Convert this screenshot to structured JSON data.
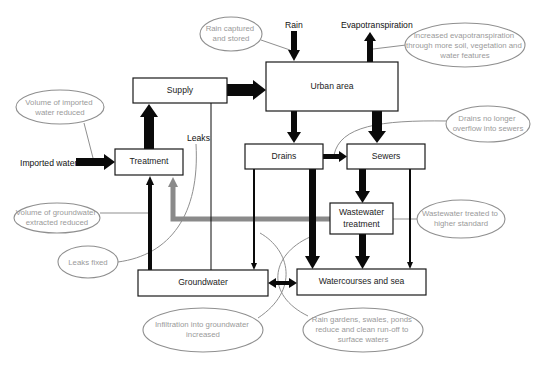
{
  "diagram": {
    "boxes": {
      "supply": {
        "label": "Supply",
        "x": 133,
        "y": 78,
        "w": 94,
        "h": 25
      },
      "urban": {
        "label": "Urban area",
        "x": 266,
        "y": 62,
        "w": 132,
        "h": 49
      },
      "treatment": {
        "label": "Treatment",
        "x": 115,
        "y": 149,
        "w": 68,
        "h": 26
      },
      "drains": {
        "label": "Drains",
        "x": 245,
        "y": 144,
        "w": 78,
        "h": 25
      },
      "sewers": {
        "label": "Sewers",
        "x": 347,
        "y": 144,
        "w": 78,
        "h": 25
      },
      "wastewater": {
        "label_line1": "Wastewater",
        "label_line2": "treatment",
        "x": 330,
        "y": 203,
        "w": 63,
        "h": 31
      },
      "groundwater": {
        "label": "Groundwater",
        "x": 138,
        "y": 270,
        "w": 130,
        "h": 26
      },
      "watercourses": {
        "label": "Watercourses and sea",
        "x": 297,
        "y": 269,
        "w": 129,
        "h": 26
      }
    },
    "flow_labels": {
      "imported_water": "Imported water",
      "rain": "Rain",
      "evapotranspiration": "Evapotranspiration",
      "leaks": "Leaks"
    },
    "notes": {
      "rain_captured": {
        "lines": [
          "Rain captured",
          "and stored"
        ],
        "cx": 231,
        "cy": 34,
        "rx": 31,
        "ry": 17
      },
      "evapotranspiration": {
        "lines": [
          "Increased evapotranspiration",
          "through more soil, vegetation and",
          "water features"
        ],
        "cx": 465,
        "cy": 45,
        "rx": 60,
        "ry": 22
      },
      "imported_reduced": {
        "lines": [
          "Volume of imported",
          "water reduced"
        ],
        "cx": 60,
        "cy": 107,
        "rx": 44,
        "ry": 17
      },
      "drains_no_overflow": {
        "lines": [
          "Drains no longer",
          "overflow into sewers"
        ],
        "cx": 488,
        "cy": 124,
        "rx": 42,
        "ry": 18
      },
      "groundwater_reduced": {
        "lines": [
          "Volume of groundwater",
          "extracted reduced"
        ],
        "cx": 57,
        "cy": 218,
        "rx": 43,
        "ry": 15
      },
      "wastewater_standard": {
        "lines": [
          "Wastewater treated to",
          "higher standard"
        ],
        "cx": 461,
        "cy": 219,
        "rx": 44,
        "ry": 19
      },
      "leaks_fixed": {
        "lines": [
          "Leaks fixed"
        ],
        "cx": 88,
        "cy": 262,
        "rx": 30,
        "ry": 16
      },
      "infiltration": {
        "lines": [
          "Infiltration into groundwater",
          "increased"
        ],
        "cx": 203,
        "cy": 330,
        "rx": 60,
        "ry": 22
      },
      "rain_gardens": {
        "lines": [
          "Rain gardens, swales, ponds",
          "reduce and clean run-off to",
          "surface waters"
        ],
        "cx": 363,
        "cy": 330,
        "rx": 60,
        "ry": 22
      }
    },
    "colors": {
      "box_stroke": "#1a1a1a",
      "flow_black": "#0a0a0a",
      "flow_gray": "#8a8a8a",
      "note_stroke": "#8f8f8f",
      "note_text": "#9a9a9a"
    }
  }
}
